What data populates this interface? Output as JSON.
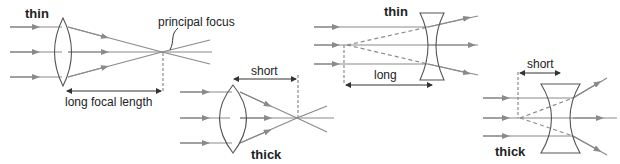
{
  "diagram": {
    "colors": {
      "ray": "#8a8a8a",
      "lens": "#555555",
      "text": "#222222",
      "dashed": "#8a8a8a"
    },
    "panels": [
      {
        "id": "convex-thin",
        "type": "converging",
        "thickness_label": "thin",
        "focus_label": "principal focus",
        "distance_label": "long focal length"
      },
      {
        "id": "convex-thick",
        "type": "converging",
        "thickness_label": "thick",
        "distance_label": "short"
      },
      {
        "id": "concave-thin",
        "type": "diverging",
        "thickness_label": "thin",
        "distance_label": "long"
      },
      {
        "id": "concave-thick",
        "type": "diverging",
        "thickness_label": "thick",
        "distance_label": "short"
      }
    ]
  }
}
